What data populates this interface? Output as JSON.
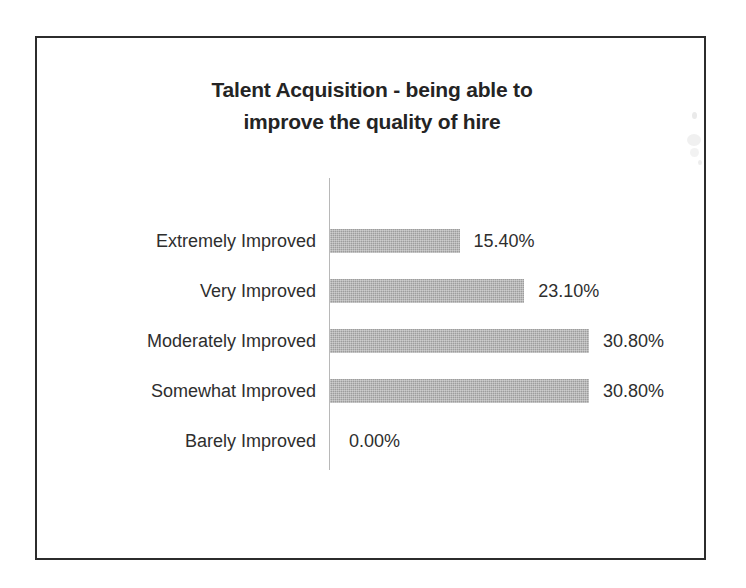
{
  "chart_data": {
    "type": "bar",
    "orientation": "horizontal",
    "title": "Talent Acquisition - being able to improve the quality of hire",
    "title_line_1": "Talent Acquisition - being able to",
    "title_line_2": "improve the quality of hire",
    "xlabel": "",
    "ylabel": "",
    "categories": [
      "Extremely Improved",
      "Very Improved",
      "Moderately Improved",
      "Somewhat Improved",
      "Barely Improved"
    ],
    "values": [
      15.4,
      23.1,
      30.8,
      30.8,
      0.0
    ],
    "value_labels": [
      "15.40%",
      "23.10%",
      "30.80%",
      "30.80%",
      "0.00%"
    ],
    "xlim": [
      0,
      35
    ],
    "grid": false,
    "legend": false,
    "bar_color": "#9d9d9d",
    "axis_color": "#b8b8b8",
    "text_color": "#2e2e2e",
    "frame_color": "#2c2c2c"
  },
  "rows": [
    {
      "category": "Extremely Improved",
      "value_label": "15.40%"
    },
    {
      "category": "Very Improved",
      "value_label": "23.10%"
    },
    {
      "category": "Moderately Improved",
      "value_label": "30.80%"
    },
    {
      "category": "Somewhat Improved",
      "value_label": "30.80%"
    },
    {
      "category": "Barely Improved",
      "value_label": "0.00%"
    }
  ]
}
